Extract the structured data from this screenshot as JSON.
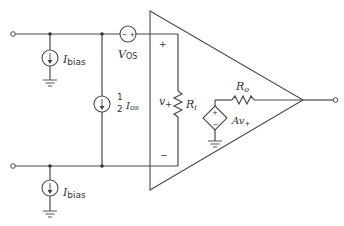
{
  "diagram": {
    "labels": {
      "ibias_top": {
        "main": "I",
        "sub": "bias"
      },
      "ibias_bottom": {
        "main": "I",
        "sub": "bias"
      },
      "ios": {
        "frac_num": "1",
        "frac_den": "2",
        "main": "I",
        "sub": "os"
      },
      "vos": {
        "main": "V",
        "sub": "OS"
      },
      "v_plus": {
        "main": "v",
        "sub": "+"
      },
      "ri": {
        "main": "R",
        "sub": "i"
      },
      "ro": {
        "main": "R",
        "sub": "o"
      },
      "av_plus": {
        "main": "Av",
        "sub": "+"
      },
      "plus_input": "+",
      "minus_input": "−",
      "vos_polarity": "− +",
      "dep_plus": "+",
      "dep_minus": "−"
    },
    "components": [
      {
        "type": "current-source",
        "name": "Ibias (top)"
      },
      {
        "type": "current-source",
        "name": "Ibias (bottom)"
      },
      {
        "type": "current-source",
        "name": "1/2 Ios"
      },
      {
        "type": "voltage-source",
        "name": "VOS"
      },
      {
        "type": "resistor",
        "name": "Ri"
      },
      {
        "type": "resistor",
        "name": "Ro"
      },
      {
        "type": "dependent-voltage-source",
        "name": "Av+"
      },
      {
        "type": "op-amp-triangle",
        "name": "amplifier"
      }
    ]
  }
}
